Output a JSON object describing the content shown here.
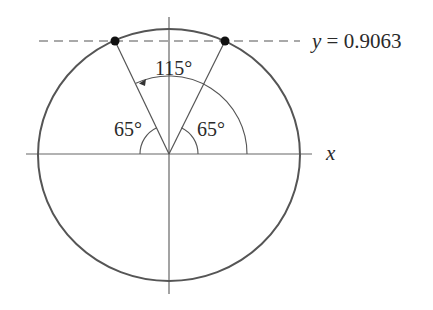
{
  "diagram": {
    "dashed_line_label": "y = 0.9063",
    "x_axis_label": "x",
    "angle_top_label": "115°",
    "angle_left_label": "65°",
    "angle_right_label": "65°",
    "points": [
      {
        "name": "point-115deg",
        "angle_deg": 115
      },
      {
        "name": "point-65deg",
        "angle_deg": 65
      }
    ],
    "colors": {
      "circle": "#555555",
      "axes": "#666666",
      "lines": "#555555",
      "points": "#111111"
    }
  }
}
